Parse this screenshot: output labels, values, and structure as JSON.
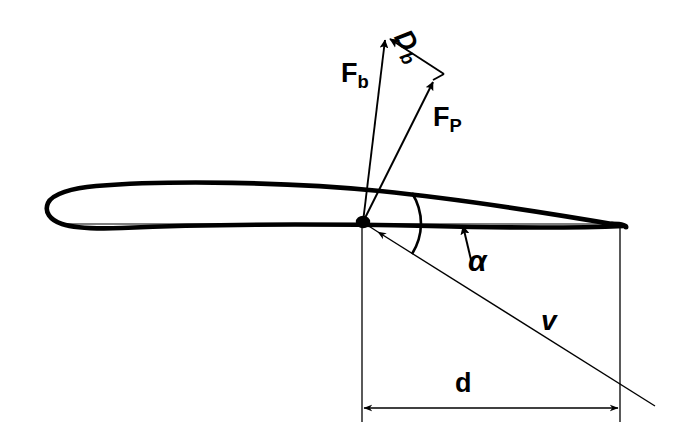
{
  "figure": {
    "background_color": "#ffffff",
    "line_color": "#000000",
    "width": 691,
    "height": 445
  },
  "labels": {
    "force_b": {
      "symbol": "F",
      "subscript": "b",
      "name": "F_b"
    },
    "drag_b": {
      "symbol": "D",
      "subscript": "b",
      "name": "D_b"
    },
    "force_p": {
      "symbol": "F",
      "subscript": "P",
      "name": "F_P"
    },
    "angle": {
      "symbol": "α",
      "name": "alpha"
    },
    "velocity": {
      "symbol": "v",
      "name": "v"
    },
    "distance": {
      "symbol": "d",
      "name": "d"
    }
  },
  "geometry": {
    "origin_point": {
      "x": 363,
      "y": 222
    },
    "vectors": [
      {
        "name": "F_b",
        "from": [
          363,
          222
        ],
        "to": [
          385,
          36
        ],
        "arrow": true
      },
      {
        "name": "D_b",
        "from": [
          385,
          36
        ],
        "to": [
          443,
          74
        ],
        "arrow": true,
        "note": "arrowhead at start, pointing up-left toward F_b tip"
      },
      {
        "name": "F_P",
        "from": [
          363,
          222
        ],
        "to": [
          432,
          78
        ],
        "arrow": true
      },
      {
        "name": "parallelogram_closure",
        "from": [
          432,
          78
        ],
        "to": [
          443,
          74
        ],
        "arrow": false
      }
    ],
    "velocity_line": {
      "from": [
        363,
        222
      ],
      "to": [
        655,
        406
      ],
      "arrow_at_origin": true
    },
    "angle_arc": {
      "center": [
        363,
        222
      ],
      "radius": 58,
      "from_deg": 0,
      "to_deg": 32
    },
    "alpha_pointer": {
      "from": [
        470,
        260
      ],
      "to": [
        462,
        228
      ],
      "arrow": true
    },
    "dimension": {
      "label": "d",
      "left_extension_x": 362,
      "right_extension_x": 620,
      "line_y": 408,
      "double_arrow": true
    },
    "airfoil": {
      "chord_line_from": [
        60,
        224
      ],
      "chord_line_to": [
        624,
        224
      ],
      "camber": "thin cambered section, leading edge at left, trailing edge at right"
    }
  }
}
